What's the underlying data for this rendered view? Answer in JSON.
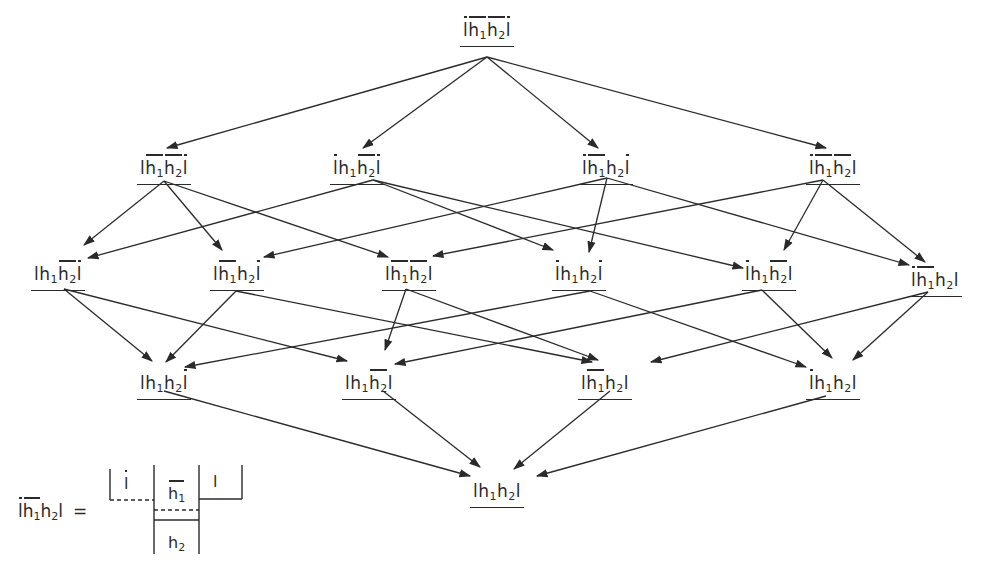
{
  "diagram": {
    "type": "lattice",
    "line_color": "#2a2a2a",
    "background": "#ffffff",
    "nodes": [
      {
        "id": "top",
        "row": 1,
        "x": 487,
        "y": 14,
        "terms": [
          [
            "l",
            true
          ],
          [
            "h",
            true,
            "1"
          ],
          [
            "h",
            true,
            "2"
          ],
          [
            "l",
            true
          ]
        ]
      },
      {
        "id": "A",
        "row": 2,
        "x": 164,
        "y": 152,
        "terms": [
          [
            "l",
            false
          ],
          [
            "h",
            true,
            "1"
          ],
          [
            "h",
            true,
            "2"
          ],
          [
            "l",
            true
          ]
        ]
      },
      {
        "id": "B",
        "row": 2,
        "x": 357,
        "y": 152,
        "terms": [
          [
            "l",
            true
          ],
          [
            "h",
            false,
            "1"
          ],
          [
            "h",
            true,
            "2"
          ],
          [
            "l",
            true
          ]
        ]
      },
      {
        "id": "C",
        "row": 2,
        "x": 606,
        "y": 152,
        "terms": [
          [
            "l",
            true
          ],
          [
            "h",
            true,
            "1"
          ],
          [
            "h",
            false,
            "2"
          ],
          [
            "l",
            true
          ]
        ]
      },
      {
        "id": "D",
        "row": 2,
        "x": 833,
        "y": 152,
        "terms": [
          [
            "l",
            true
          ],
          [
            "h",
            true,
            "1"
          ],
          [
            "h",
            true,
            "2"
          ],
          [
            "l",
            false
          ]
        ]
      },
      {
        "id": "E",
        "row": 3,
        "x": 58,
        "y": 258,
        "terms": [
          [
            "l",
            false
          ],
          [
            "h",
            false,
            "1"
          ],
          [
            "h",
            true,
            "2"
          ],
          [
            "l",
            true
          ]
        ]
      },
      {
        "id": "F",
        "row": 3,
        "x": 237,
        "y": 258,
        "terms": [
          [
            "l",
            false
          ],
          [
            "h",
            true,
            "1"
          ],
          [
            "h",
            false,
            "2"
          ],
          [
            "l",
            true
          ]
        ]
      },
      {
        "id": "G",
        "row": 3,
        "x": 409,
        "y": 258,
        "terms": [
          [
            "l",
            false
          ],
          [
            "h",
            true,
            "1"
          ],
          [
            "h",
            true,
            "2"
          ],
          [
            "l",
            false
          ]
        ]
      },
      {
        "id": "H",
        "row": 3,
        "x": 579,
        "y": 258,
        "terms": [
          [
            "l",
            true
          ],
          [
            "h",
            false,
            "1"
          ],
          [
            "h",
            false,
            "2"
          ],
          [
            "l",
            true
          ]
        ]
      },
      {
        "id": "I",
        "row": 3,
        "x": 769,
        "y": 258,
        "terms": [
          [
            "l",
            true
          ],
          [
            "h",
            false,
            "1"
          ],
          [
            "h",
            true,
            "2"
          ],
          [
            "l",
            false
          ]
        ]
      },
      {
        "id": "J",
        "row": 3,
        "x": 935,
        "y": 264,
        "terms": [
          [
            "l",
            true
          ],
          [
            "h",
            true,
            "1"
          ],
          [
            "h",
            false,
            "2"
          ],
          [
            "l",
            false
          ]
        ]
      },
      {
        "id": "K",
        "row": 4,
        "x": 164,
        "y": 367,
        "terms": [
          [
            "l",
            false
          ],
          [
            "h",
            false,
            "1"
          ],
          [
            "h",
            false,
            "2"
          ],
          [
            "l",
            true
          ]
        ]
      },
      {
        "id": "L",
        "row": 4,
        "x": 369,
        "y": 367,
        "terms": [
          [
            "l",
            false
          ],
          [
            "h",
            false,
            "1"
          ],
          [
            "h",
            true,
            "2"
          ],
          [
            "l",
            false
          ]
        ]
      },
      {
        "id": "M",
        "row": 4,
        "x": 605,
        "y": 367,
        "terms": [
          [
            "l",
            false
          ],
          [
            "h",
            true,
            "1"
          ],
          [
            "h",
            false,
            "2"
          ],
          [
            "l",
            false
          ]
        ]
      },
      {
        "id": "N",
        "row": 4,
        "x": 833,
        "y": 367,
        "terms": [
          [
            "l",
            true
          ],
          [
            "h",
            false,
            "1"
          ],
          [
            "h",
            false,
            "2"
          ],
          [
            "l",
            false
          ]
        ]
      },
      {
        "id": "bottom",
        "row": 5,
        "x": 497,
        "y": 475,
        "terms": [
          [
            "l",
            false
          ],
          [
            "h",
            false,
            "1"
          ],
          [
            "h",
            false,
            "2"
          ],
          [
            "l",
            false
          ]
        ]
      }
    ],
    "edges": [
      {
        "from": "top",
        "to": "A",
        "x1": 487,
        "y1": 57,
        "x2": 167,
        "y2": 148
      },
      {
        "from": "top",
        "to": "B",
        "x1": 487,
        "y1": 57,
        "x2": 363,
        "y2": 148
      },
      {
        "from": "top",
        "to": "C",
        "x1": 487,
        "y1": 57,
        "x2": 598,
        "y2": 148
      },
      {
        "from": "top",
        "to": "D",
        "x1": 487,
        "y1": 57,
        "x2": 826,
        "y2": 148
      },
      {
        "from": "A",
        "to": "E",
        "x1": 164,
        "y1": 181,
        "x2": 84,
        "y2": 245
      },
      {
        "from": "A",
        "to": "F",
        "x1": 164,
        "y1": 181,
        "x2": 222,
        "y2": 250
      },
      {
        "from": "A",
        "to": "G",
        "x1": 164,
        "y1": 181,
        "x2": 388,
        "y2": 257
      },
      {
        "from": "B",
        "to": "E",
        "x1": 373,
        "y1": 180,
        "x2": 88,
        "y2": 258
      },
      {
        "from": "B",
        "to": "H",
        "x1": 373,
        "y1": 180,
        "x2": 553,
        "y2": 250
      },
      {
        "from": "B",
        "to": "I",
        "x1": 373,
        "y1": 180,
        "x2": 743,
        "y2": 268
      },
      {
        "from": "C",
        "to": "F",
        "x1": 607,
        "y1": 178,
        "x2": 264,
        "y2": 257
      },
      {
        "from": "C",
        "to": "H",
        "x1": 607,
        "y1": 178,
        "x2": 589,
        "y2": 252
      },
      {
        "from": "C",
        "to": "J",
        "x1": 607,
        "y1": 178,
        "x2": 909,
        "y2": 265
      },
      {
        "from": "D",
        "to": "G",
        "x1": 823,
        "y1": 180,
        "x2": 433,
        "y2": 256
      },
      {
        "from": "D",
        "to": "I",
        "x1": 823,
        "y1": 180,
        "x2": 784,
        "y2": 250
      },
      {
        "from": "D",
        "to": "J",
        "x1": 823,
        "y1": 180,
        "x2": 925,
        "y2": 262
      },
      {
        "from": "E",
        "to": "K",
        "x1": 64,
        "y1": 289,
        "x2": 152,
        "y2": 361
      },
      {
        "from": "E",
        "to": "L",
        "x1": 64,
        "y1": 289,
        "x2": 347,
        "y2": 361
      },
      {
        "from": "F",
        "to": "K",
        "x1": 236,
        "y1": 291,
        "x2": 166,
        "y2": 362
      },
      {
        "from": "F",
        "to": "M",
        "x1": 236,
        "y1": 291,
        "x2": 592,
        "y2": 362
      },
      {
        "from": "G",
        "to": "L",
        "x1": 406,
        "y1": 289,
        "x2": 385,
        "y2": 350
      },
      {
        "from": "G",
        "to": "M",
        "x1": 406,
        "y1": 289,
        "x2": 598,
        "y2": 360
      },
      {
        "from": "H",
        "to": "K",
        "x1": 590,
        "y1": 291,
        "x2": 185,
        "y2": 367
      },
      {
        "from": "H",
        "to": "N",
        "x1": 590,
        "y1": 291,
        "x2": 806,
        "y2": 367
      },
      {
        "from": "I",
        "to": "L",
        "x1": 762,
        "y1": 290,
        "x2": 395,
        "y2": 364
      },
      {
        "from": "I",
        "to": "N",
        "x1": 762,
        "y1": 290,
        "x2": 832,
        "y2": 358
      },
      {
        "from": "J",
        "to": "M",
        "x1": 928,
        "y1": 292,
        "x2": 651,
        "y2": 362
      },
      {
        "from": "J",
        "to": "N",
        "x1": 928,
        "y1": 292,
        "x2": 853,
        "y2": 360
      },
      {
        "from": "K",
        "to": "bottom",
        "x1": 164,
        "y1": 391,
        "x2": 470,
        "y2": 476
      },
      {
        "from": "L",
        "to": "bottom",
        "x1": 383,
        "y1": 391,
        "x2": 480,
        "y2": 467
      },
      {
        "from": "M",
        "to": "bottom",
        "x1": 610,
        "y1": 391,
        "x2": 514,
        "y2": 469
      },
      {
        "from": "N",
        "to": "bottom",
        "x1": 826,
        "y1": 396,
        "x2": 537,
        "y2": 476
      }
    ],
    "subscripts": {
      "one": "1",
      "two": "2"
    },
    "legend": {
      "lhs_terms": [
        [
          "l",
          true
        ],
        [
          "h",
          true,
          "1"
        ],
        [
          "h",
          false,
          "2"
        ],
        [
          "l",
          false
        ]
      ],
      "equals": "=",
      "cells": {
        "left": {
          "letter": "l",
          "bar": true
        },
        "middle_top": {
          "letter": "h",
          "sub": "1",
          "bar": true
        },
        "middle_bottom": {
          "letter": "h",
          "sub": "2",
          "bar": false
        },
        "right": {
          "letter": "l",
          "bar": false
        }
      }
    }
  }
}
